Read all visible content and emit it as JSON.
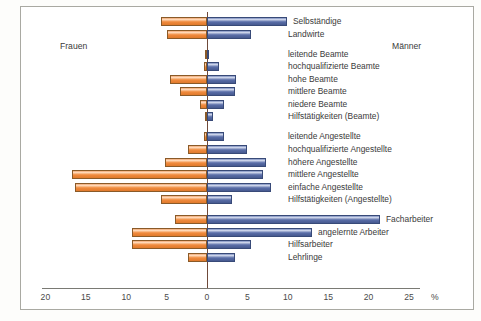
{
  "figure": {
    "credit": "u. Stat. Jb., 2002, S. 171, Graphik: Musil",
    "left_group_label": "Frauen",
    "right_group_label": "Männer",
    "unit_symbol": "%"
  },
  "chart_data": {
    "type": "bar",
    "orientation": "horizontal-diverging",
    "title": "",
    "subtitle": "",
    "xlabel": "%",
    "ylabel": "",
    "xlim": [
      -20,
      25
    ],
    "grid": false,
    "legend_position": "inline-labels",
    "axis_ticks": [
      {
        "label": "20",
        "value": -20
      },
      {
        "label": "15",
        "value": -15
      },
      {
        "label": "10",
        "value": -10
      },
      {
        "label": "5",
        "value": -5
      },
      {
        "label": "0",
        "value": 0
      },
      {
        "label": "5",
        "value": 5
      },
      {
        "label": "10",
        "value": 10
      },
      {
        "label": "15",
        "value": 15
      },
      {
        "label": "20",
        "value": 20
      },
      {
        "label": "25",
        "value": 25
      }
    ],
    "colors": {
      "frauen": "#f08b3e",
      "maenner": "#5a6ea8",
      "axis": "#6f4a3a",
      "frame": "#a9a9a2"
    },
    "categories": [
      "Selbständige",
      "Landwirte",
      "leitende Beamte",
      "hochqualifizierte Beamte",
      "hohe Beamte",
      "mittlere Beamte",
      "niedere Beamte",
      "Hilfstätigkeiten (Beamte)",
      "leitende Angestellte",
      "hochqualifizierte Angestellte",
      "höhere Angestellte",
      "mittlere Angestellte",
      "einfache Angestellte",
      "Hilfstätigkeiten (Angestellte)",
      "Facharbeiter",
      "angelernte Arbeiter",
      "Hilfsarbeiter",
      "Lehrlinge"
    ],
    "series": [
      {
        "name": "Frauen",
        "color": "#f08b3e",
        "direction": "left",
        "values": [
          5.7,
          5.0,
          0.2,
          0.4,
          4.6,
          3.3,
          0.9,
          0.3,
          0.4,
          2.3,
          5.2,
          16.7,
          16.3,
          5.7,
          4.0,
          9.3,
          9.3,
          2.3
        ]
      },
      {
        "name": "Männer",
        "color": "#5a6ea8",
        "direction": "right",
        "values": [
          9.9,
          5.4,
          0.3,
          1.5,
          3.6,
          3.5,
          2.1,
          0.8,
          2.1,
          4.9,
          7.3,
          6.9,
          7.9,
          3.1,
          21.4,
          13.0,
          5.5,
          3.5
        ]
      }
    ],
    "label_side": [
      "right",
      "right",
      "right",
      "right",
      "right",
      "right",
      "right",
      "right",
      "right",
      "right",
      "right",
      "right",
      "right",
      "right",
      "right",
      "right",
      "right",
      "right"
    ],
    "group_breaks_after": [
      1,
      7,
      13
    ]
  }
}
